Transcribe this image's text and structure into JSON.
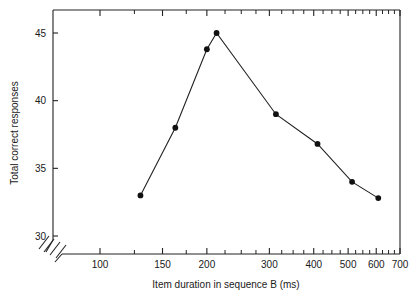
{
  "chart_data": {
    "type": "line",
    "title": "",
    "subtitle": "",
    "xlabel": "Item duration in sequence B (ms)",
    "ylabel": "Total correct responses",
    "xscale": "log",
    "yscale": "linear",
    "xlim": [
      100,
      700
    ],
    "ylim": [
      29,
      46
    ],
    "grid": false,
    "legend": false,
    "legend_position": "none",
    "axis_break": "x-axis origin break (double slash)",
    "marker": "filled-circle",
    "x_tick_labels": [
      "100",
      "150",
      "200",
      "300",
      "400",
      "500",
      "600",
      "700"
    ],
    "x_tick_values": [
      100,
      150,
      200,
      300,
      400,
      500,
      600,
      700
    ],
    "x_minor_ticks": [
      125,
      175,
      225,
      250,
      275,
      325,
      350,
      375,
      425,
      450,
      475,
      525,
      550,
      575,
      625,
      650,
      675
    ],
    "y_tick_labels": [
      "30",
      "35",
      "40",
      "45"
    ],
    "y_tick_values": [
      30,
      35,
      40,
      45
    ],
    "x": [
      130,
      163,
      200,
      213,
      313,
      410,
      513,
      608
    ],
    "values": [
      33,
      38,
      43.8,
      45,
      39,
      36.8,
      34,
      32.8
    ],
    "series": [
      {
        "name": "Total correct responses",
        "x": [
          130,
          163,
          200,
          213,
          313,
          410,
          513,
          608
        ],
        "values": [
          33,
          38,
          43.8,
          45,
          39,
          36.8,
          34,
          32.8
        ]
      }
    ],
    "colors": {
      "line": "#222222",
      "marker": "#111111",
      "axis": "#222222",
      "background": "#ffffff"
    }
  }
}
